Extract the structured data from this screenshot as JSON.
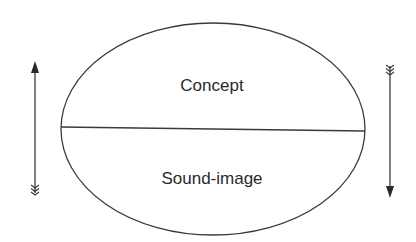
{
  "diagram": {
    "ellipse": {
      "cx": 213,
      "cy": 129,
      "rx": 152,
      "ry": 106
    },
    "top_label": "Concept",
    "bottom_label": "Sound-image",
    "arrows": [
      {
        "name": "left-arrow",
        "direction": "up",
        "x": 35,
        "from_y": 193,
        "to_y": 62
      },
      {
        "name": "right-arrow",
        "direction": "down",
        "x": 390,
        "from_y": 65,
        "to_y": 197
      }
    ],
    "colors": {
      "stroke": "#3a3a3a",
      "text": "#2a2a2a",
      "background": "#ffffff"
    }
  }
}
